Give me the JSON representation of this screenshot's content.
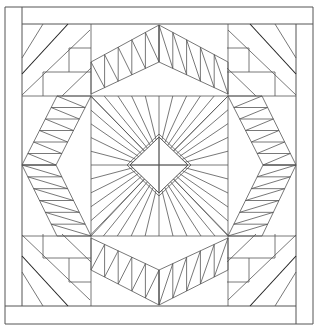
{
  "diagram": {
    "stroke": "#555555",
    "stroke_dark": "#222222",
    "background": "#ffffff",
    "frame": {
      "outer": [
        5,
        7,
        313,
        324
      ],
      "left_strip_x": 22,
      "right_strip_x": 296,
      "top_strip_y": 24,
      "bottom_strip_y": 306
    },
    "grid": {
      "x": [
        22,
        91,
        159,
        228,
        296
      ],
      "y": [
        24,
        96,
        165,
        236,
        306
      ]
    },
    "center_diamond": {
      "points": [
        [
          159,
          137
        ],
        [
          188,
          165
        ],
        [
          159,
          193
        ],
        [
          130,
          165
        ]
      ],
      "offset_points": [
        [
          159,
          134
        ],
        [
          191,
          165
        ],
        [
          159,
          196
        ],
        [
          127,
          165
        ]
      ]
    },
    "ray_count_per_quadrant": 9
  }
}
